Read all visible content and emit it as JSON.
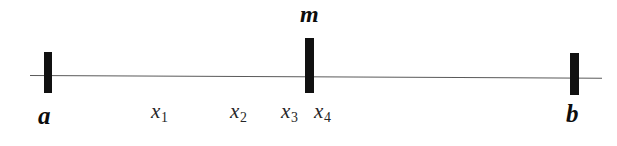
{
  "figure": {
    "type": "number-line-diagram",
    "background_color": "#ffffff",
    "line_color": "#5a5a5a",
    "tick_color": "#111111",
    "text_color": "#0d0d0d"
  },
  "axis": {
    "start_label": "a",
    "end_label": "b",
    "midpoint_label": "m"
  },
  "ticks": [
    {
      "name": "a",
      "label": "a"
    },
    {
      "name": "m",
      "label": "m"
    },
    {
      "name": "b",
      "label": "b"
    }
  ],
  "sample_points": [
    {
      "name": "x1",
      "label": "x",
      "subscript": "1"
    },
    {
      "name": "x2",
      "label": "x",
      "subscript": "2"
    },
    {
      "name": "x3",
      "label": "x",
      "subscript": "3"
    },
    {
      "name": "x4",
      "label": "x",
      "subscript": "4"
    }
  ]
}
